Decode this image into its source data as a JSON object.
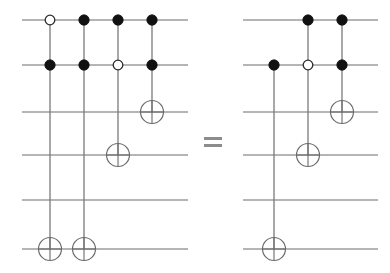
{
  "figure": {
    "kind": "quantum-circuit-identity",
    "equals_symbol": "=",
    "wire_count": 6,
    "wire_y": [
      20,
      65,
      112,
      155,
      200,
      249
    ],
    "stroke_colors": {
      "wire": "#6d6d6d",
      "control_link": "#7a7a7a",
      "filled_control": "#111111",
      "open_control_fill": "#ffffff",
      "open_control_stroke": "#2b2b2b",
      "target": "#6b6b6b",
      "equals": "#8c8c8c"
    }
  },
  "left_circuit": {
    "label": "left-circuit",
    "wire_x_start": 22,
    "wire_x_end": 188,
    "gates": [
      {
        "name": "gate-1",
        "column_x": 50,
        "controls": [
          {
            "wire": 0,
            "type": "open"
          },
          {
            "wire": 1,
            "type": "filled"
          }
        ],
        "target": {
          "wire": 5
        }
      },
      {
        "name": "gate-2",
        "column_x": 84,
        "controls": [
          {
            "wire": 0,
            "type": "filled"
          },
          {
            "wire": 1,
            "type": "filled"
          }
        ],
        "target": {
          "wire": 5
        }
      },
      {
        "name": "gate-3",
        "column_x": 118,
        "controls": [
          {
            "wire": 0,
            "type": "filled"
          },
          {
            "wire": 1,
            "type": "open"
          }
        ],
        "target": {
          "wire": 3
        }
      },
      {
        "name": "gate-4",
        "column_x": 152,
        "controls": [
          {
            "wire": 0,
            "type": "filled"
          },
          {
            "wire": 1,
            "type": "filled"
          }
        ],
        "target": {
          "wire": 2
        }
      }
    ]
  },
  "equals": {
    "label": "=",
    "x": 204,
    "y": 137,
    "bar_width": 18,
    "bar_height": 3,
    "bar_gap": 7
  },
  "right_circuit": {
    "label": "right-circuit",
    "wire_x_start": 243,
    "wire_x_end": 378,
    "gates": [
      {
        "name": "gate-1",
        "column_x": 274,
        "controls": [
          {
            "wire": 1,
            "type": "filled"
          }
        ],
        "target": {
          "wire": 5
        }
      },
      {
        "name": "gate-2",
        "column_x": 308,
        "controls": [
          {
            "wire": 0,
            "type": "filled"
          },
          {
            "wire": 1,
            "type": "open"
          }
        ],
        "target": {
          "wire": 3
        }
      },
      {
        "name": "gate-3",
        "column_x": 342,
        "controls": [
          {
            "wire": 0,
            "type": "filled"
          },
          {
            "wire": 1,
            "type": "filled"
          }
        ],
        "target": {
          "wire": 2
        }
      }
    ]
  },
  "geometry": {
    "dot_radius_filled": 5.2,
    "dot_radius_open": 4.8,
    "target_radius": 11.5
  }
}
